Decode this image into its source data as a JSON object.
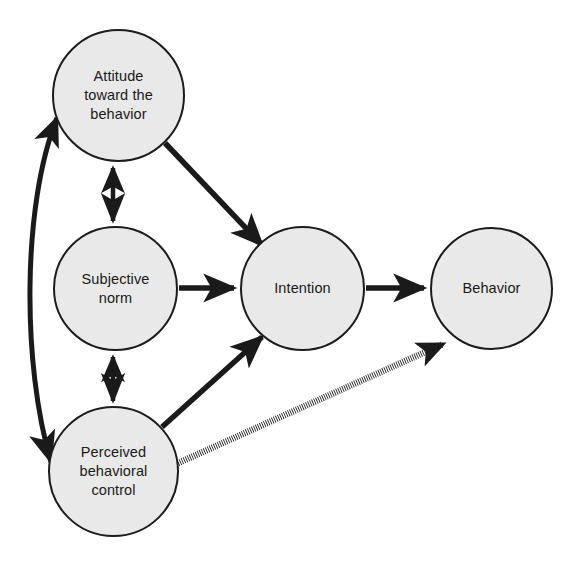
{
  "diagram": {
    "background_color": "#ffffff",
    "node_fill_color": "#e9e9e9",
    "node_stroke_color": "#1c1c1c",
    "edge_color": "#1a1a1a",
    "nodes": [
      {
        "id": "attitude",
        "label": "Attitude\ntoward the\nbehavior",
        "cx": 118,
        "cy": 95,
        "r": 66
      },
      {
        "id": "subjective_norm",
        "label": "Subjective\nnorm",
        "cx": 115,
        "cy": 288,
        "r": 62
      },
      {
        "id": "pbc",
        "label": "Perceived\nbehavioral\ncontrol",
        "cx": 113,
        "cy": 471,
        "r": 65
      },
      {
        "id": "intention",
        "label": "Intention",
        "cx": 302,
        "cy": 288,
        "r": 62
      },
      {
        "id": "behavior",
        "label": "Behavior",
        "cx": 491,
        "cy": 288,
        "r": 61
      }
    ],
    "edges": [
      {
        "id": "attitude-to-intention",
        "from": "attitude",
        "to": "intention",
        "style": "solid",
        "heads": "single"
      },
      {
        "id": "norm-to-intention",
        "from": "subjective_norm",
        "to": "intention",
        "style": "solid",
        "heads": "single"
      },
      {
        "id": "pbc-to-intention",
        "from": "pbc",
        "to": "intention",
        "style": "solid",
        "heads": "single"
      },
      {
        "id": "intention-to-behavior",
        "from": "intention",
        "to": "behavior",
        "style": "solid",
        "heads": "single"
      },
      {
        "id": "pbc-to-behavior",
        "from": "pbc",
        "to": "behavior",
        "style": "dotted",
        "heads": "single"
      },
      {
        "id": "attitude-norm-correlation",
        "from": "attitude",
        "to": "subjective_norm",
        "style": "solid",
        "heads": "double"
      },
      {
        "id": "norm-pbc-correlation",
        "from": "subjective_norm",
        "to": "pbc",
        "style": "solid",
        "heads": "double"
      },
      {
        "id": "attitude-pbc-correlation",
        "from": "attitude",
        "to": "pbc",
        "style": "solid",
        "heads": "double",
        "curved": true
      }
    ]
  }
}
